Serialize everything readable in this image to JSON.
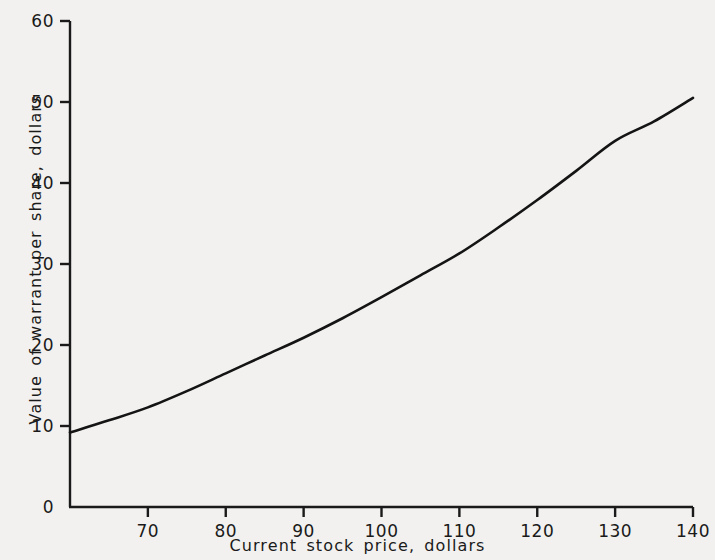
{
  "figure": {
    "background_color": "#f2f1ef",
    "ink_color": "#1a1a1a"
  },
  "chart_data": {
    "type": "line",
    "title": "",
    "xlabel": "Current stock price, dollars",
    "ylabel": "Value of warrant per share, dollars",
    "xlim": [
      60,
      140
    ],
    "ylim": [
      0,
      60
    ],
    "xticks": [
      70,
      80,
      90,
      100,
      110,
      120,
      130,
      140
    ],
    "xtick_labels": [
      "70",
      "80",
      "90",
      "100",
      "110",
      "120",
      "130",
      "140"
    ],
    "yticks": [
      0,
      10,
      20,
      30,
      40,
      50,
      60
    ],
    "ytick_labels": [
      "0",
      "10",
      "20",
      "30",
      "40",
      "50",
      "60"
    ],
    "grid": false,
    "legend": null,
    "series": [
      {
        "name": "Warrant value",
        "x": [
          60,
          65,
          70,
          75,
          80,
          85,
          90,
          95,
          100,
          105,
          110,
          115,
          120,
          125,
          130,
          135,
          140
        ],
        "y": [
          9.2,
          10.7,
          12.3,
          14.3,
          16.5,
          18.7,
          20.9,
          23.3,
          25.9,
          28.6,
          31.3,
          34.5,
          37.9,
          41.5,
          45.2,
          47.6,
          50.5
        ]
      }
    ]
  },
  "axis_labels": {
    "x_title": "Current stock price, dollars",
    "y_title": "Value of warrant per share, dollars"
  }
}
